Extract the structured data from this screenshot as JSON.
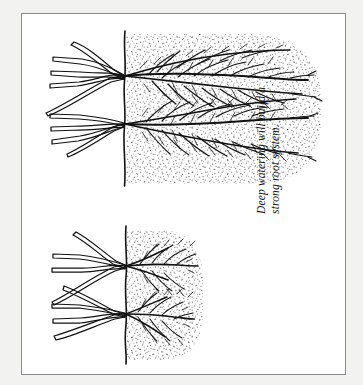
{
  "figure": {
    "title": "Deep watering will build a strong root system.",
    "medium": "pen-and-ink line drawing",
    "orientation_note": "illustration rotated 90 degrees; ground line is vertical",
    "frame": {
      "border_color": "#8c8c8c",
      "background_color": "#ffffff",
      "page_background_color": "#f2f2f0"
    },
    "ink_color": "#111111",
    "soil_stipple_color": "#1a1a1a"
  },
  "caption": {
    "full_text": "Deep watering will build a strong root system.",
    "line1": "Deep watering will build a",
    "line2": "strong root system.",
    "style": "italic serif",
    "rotation_degrees": -90
  },
  "panels": [
    {
      "id": "deep-watered-plant",
      "label": "Deep watering",
      "position": "upper",
      "root_depth": "deep",
      "root_description": "dense, extensive fibrous root mass penetrating far into soil",
      "soil_zone_shape": "large rounded column of moist soil",
      "crown_count": 2,
      "branch_count": 9
    },
    {
      "id": "shallow-watered-plant",
      "label": "Shallow watering",
      "position": "lower",
      "root_depth": "shallow",
      "root_description": "short, sparse roots confined near the surface",
      "soil_zone_shape": "small semicircular patch of moist soil",
      "crown_count": 2,
      "branch_count": 7
    }
  ]
}
